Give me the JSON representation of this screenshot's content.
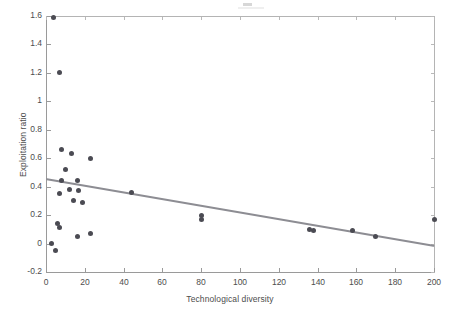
{
  "figure": {
    "background_color": "#ffffff",
    "marker_color": "#4b4b53",
    "line_color": "#8d8d93",
    "axis_color": "#9a9a9a"
  },
  "chart_data": {
    "type": "scatter",
    "title": "",
    "xlabel": "Technological diversity",
    "ylabel": "Exploitation ratio",
    "xlim": [
      0,
      200
    ],
    "ylim": [
      -0.2,
      1.6
    ],
    "xticks": [
      0,
      20,
      40,
      60,
      80,
      100,
      120,
      140,
      160,
      180,
      200
    ],
    "xticklabels": [
      "0",
      "20",
      "40",
      "60",
      "80",
      "100",
      "120",
      "140",
      "160",
      "180",
      "200"
    ],
    "yticks": [
      -0.2,
      0,
      0.2,
      0.4,
      0.6,
      0.8,
      1,
      1.2,
      1.4,
      1.6
    ],
    "yticklabels": [
      "-0.2",
      "0",
      "0.2",
      "0.4",
      "0.6",
      "0.8",
      "1",
      "1.2",
      "1.4",
      "1.6"
    ],
    "grid": false,
    "legend": null,
    "points": [
      {
        "x": 4,
        "y": 1.59
      },
      {
        "x": 7,
        "y": 1.2
      },
      {
        "x": 8,
        "y": 0.66
      },
      {
        "x": 13,
        "y": 0.63
      },
      {
        "x": 23,
        "y": 0.6
      },
      {
        "x": 10,
        "y": 0.52
      },
      {
        "x": 8,
        "y": 0.44
      },
      {
        "x": 16,
        "y": 0.44
      },
      {
        "x": 12,
        "y": 0.38
      },
      {
        "x": 17,
        "y": 0.37
      },
      {
        "x": 44,
        "y": 0.36
      },
      {
        "x": 7,
        "y": 0.35
      },
      {
        "x": 14,
        "y": 0.3
      },
      {
        "x": 19,
        "y": 0.29
      },
      {
        "x": 80,
        "y": 0.2
      },
      {
        "x": 80,
        "y": 0.17
      },
      {
        "x": 200,
        "y": 0.17
      },
      {
        "x": 6,
        "y": 0.14
      },
      {
        "x": 7,
        "y": 0.11
      },
      {
        "x": 136,
        "y": 0.1
      },
      {
        "x": 138,
        "y": 0.09
      },
      {
        "x": 158,
        "y": 0.09
      },
      {
        "x": 23,
        "y": 0.07
      },
      {
        "x": 16,
        "y": 0.05
      },
      {
        "x": 170,
        "y": 0.05
      },
      {
        "x": 3,
        "y": 0.0
      },
      {
        "x": 5,
        "y": -0.05
      }
    ],
    "trendline": {
      "x_start": 0,
      "y_start": 0.45,
      "x_end": 200,
      "y_end": -0.02,
      "slope": -0.00235,
      "intercept": 0.45
    }
  }
}
